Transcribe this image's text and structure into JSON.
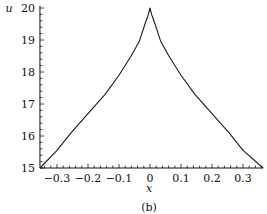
{
  "chart_data": {
    "type": "line",
    "title": "",
    "caption": "(b)",
    "xlabel": "x",
    "ylabel": "u",
    "xlim": [
      -0.355,
      0.365
    ],
    "ylim": [
      15,
      20
    ],
    "grid": false,
    "legend": null,
    "x_ticks": [
      -0.3,
      -0.2,
      -0.1,
      0,
      0.1,
      0.2,
      0.3
    ],
    "x_tick_labels": [
      "−0.3",
      "−0.2",
      "−0.1",
      "0",
      "0.1",
      "0.2",
      "0.3"
    ],
    "y_ticks": [
      15,
      16,
      17,
      18,
      19,
      20
    ],
    "y_tick_labels": [
      "15",
      "16",
      "17",
      "18",
      "19",
      "20"
    ],
    "series": [
      {
        "name": "u(x)",
        "color": "#1a1a1a",
        "x": [
          -0.355,
          -0.3,
          -0.255,
          -0.2,
          -0.145,
          -0.1,
          -0.061,
          -0.035,
          -0.016,
          -0.005,
          0,
          0.005,
          0.016,
          0.035,
          0.061,
          0.1,
          0.145,
          0.2,
          0.255,
          0.3,
          0.365
        ],
        "y": [
          15.0,
          15.55,
          16.1,
          16.7,
          17.3,
          17.9,
          18.5,
          18.95,
          19.5,
          19.8,
          20.0,
          19.8,
          19.5,
          18.95,
          18.5,
          17.9,
          17.3,
          16.7,
          16.1,
          15.55,
          15.0
        ]
      }
    ]
  }
}
